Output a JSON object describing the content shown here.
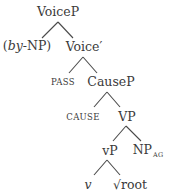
{
  "tree": {
    "type": "syntax-tree",
    "nodes": {
      "voicep": {
        "label": "VoiceP"
      },
      "bynp": {
        "open": "(",
        "italic": "by",
        "rest": "-NP",
        "close": ")"
      },
      "voicebar": {
        "label": "Voice′"
      },
      "pass": {
        "label": "PASS"
      },
      "causep": {
        "label": "CauseP"
      },
      "cause": {
        "label": "CAUSE"
      },
      "vp_upper": {
        "label": "VP"
      },
      "vp_lower": {
        "label": "vP"
      },
      "np_ag": {
        "label": "NP",
        "subscript": "AG"
      },
      "v": {
        "label": "v"
      },
      "root": {
        "label": "√root"
      }
    },
    "edges": [
      [
        "VoiceP",
        "(by-NP)"
      ],
      [
        "VoiceP",
        "Voice′"
      ],
      [
        "Voice′",
        "PASS"
      ],
      [
        "Voice′",
        "CauseP"
      ],
      [
        "CauseP",
        "CAUSE"
      ],
      [
        "CauseP",
        "VP"
      ],
      [
        "VP",
        "vP"
      ],
      [
        "VP",
        "NP_AG"
      ],
      [
        "vP",
        "v"
      ],
      [
        "vP",
        "√root"
      ]
    ]
  }
}
